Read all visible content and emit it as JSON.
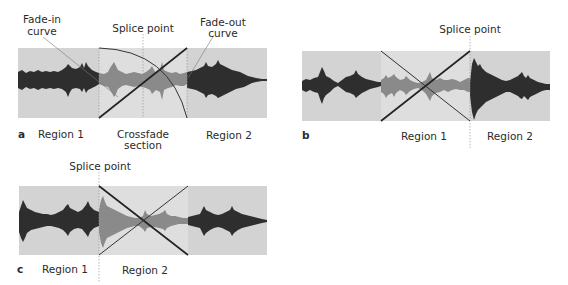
{
  "colors": {
    "region_bg": "#d3d3d3",
    "crossfade_bg": "#dedede",
    "wave_dark": "#2e2e2e",
    "wave_crossfade": "#8a8a8a",
    "curve_line": "#222222",
    "thin_line": "#555555",
    "splice_dotted": "#9a9a9a"
  },
  "panels": [
    {
      "letter": "a",
      "labels": {
        "fade_in": [
          "Fade-in",
          "curve"
        ],
        "splice_point": "Splice point",
        "fade_out": [
          "Fade-out",
          "curve"
        ],
        "region1": "Region 1",
        "crossfade": [
          "Crossfade",
          "section"
        ],
        "region2": "Region 2"
      }
    },
    {
      "letter": "b",
      "labels": {
        "splice_point": "Splice point",
        "region1": "Region 1",
        "region2": "Region 2"
      }
    },
    {
      "letter": "c",
      "labels": {
        "splice_point": "Splice point",
        "region1": "Region 1",
        "region2": "Region 2"
      }
    }
  ]
}
